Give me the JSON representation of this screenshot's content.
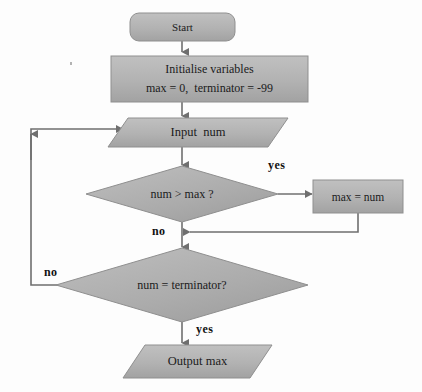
{
  "diagram": {
    "colors": {
      "shape_fill": "#b3b3b3",
      "shape_fill_dark": "#a0a0a0",
      "shape_stroke": "#8a8a8a",
      "connector": "#6f6f6f",
      "text": "#1b1b1b",
      "background": "#fdfdfd"
    },
    "nodes": [
      {
        "id": "start",
        "shape": "rounded-rectangle",
        "label": "Start"
      },
      {
        "id": "initialise",
        "shape": "rectangle",
        "label_line1": "Initialise variables",
        "label_line2": "max = 0,  terminator = -99"
      },
      {
        "id": "input",
        "shape": "parallelogram",
        "label": "Input  num"
      },
      {
        "id": "decision-max",
        "shape": "diamond",
        "label": "num > max ?"
      },
      {
        "id": "assign-max",
        "shape": "rectangle",
        "label": "max = num"
      },
      {
        "id": "decision-terminator",
        "shape": "diamond",
        "label": "num = terminator?"
      },
      {
        "id": "output",
        "shape": "parallelogram",
        "label": "Output max"
      }
    ],
    "edge_labels": {
      "yes_max": "yes",
      "no_max": "no",
      "no_terminator": "no",
      "yes_terminator": "yes"
    }
  }
}
